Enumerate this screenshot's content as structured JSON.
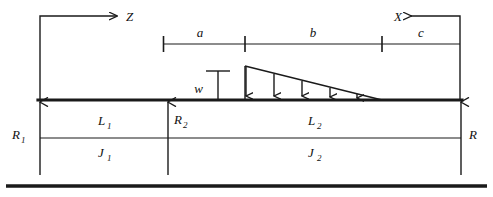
{
  "diagram": {
    "axes": [
      {
        "name": "z-axis",
        "label": "Z",
        "direction": "right"
      },
      {
        "name": "x-axis",
        "label": "X",
        "direction": "left"
      }
    ],
    "dimensions": [
      {
        "name": "dim-a",
        "label": "a",
        "x_start": 163,
        "x_end": 245
      },
      {
        "name": "dim-b",
        "label": "b",
        "x_start": 245,
        "x_end": 382
      },
      {
        "name": "dim-c",
        "label": "c",
        "x_start": 382,
        "x_end": 460
      }
    ],
    "load": {
      "label": "w",
      "type": "triangular-distributed",
      "x_start": 245,
      "x_end": 382,
      "peak_y": 66,
      "base_y": 100,
      "arrow_count": 5
    },
    "supports": [
      {
        "name": "support-R1",
        "label": "R",
        "subscript": "1",
        "x": 40
      },
      {
        "name": "support-R2",
        "label": "R",
        "subscript": "2",
        "x": 168
      },
      {
        "name": "support-R",
        "label": "R",
        "subscript": "",
        "x": 461
      }
    ],
    "spans": [
      {
        "name": "span-L1",
        "label": "L",
        "subscript": "1",
        "center_x": 104
      },
      {
        "name": "span-L2",
        "label": "L",
        "subscript": "2",
        "center_x": 314
      }
    ],
    "inertias": [
      {
        "name": "inertia-J1",
        "label": "J",
        "subscript": "1",
        "center_x": 104
      },
      {
        "name": "inertia-J2",
        "label": "J",
        "subscript": "2",
        "center_x": 314
      }
    ],
    "labels": {
      "z": "Z",
      "x": "X",
      "a": "a",
      "b": "b",
      "c": "c",
      "w": "w",
      "R1_base": "R",
      "R1_sub": "1",
      "R2_base": "R",
      "R2_sub": "2",
      "R_base": "R",
      "L1_base": "L",
      "L1_sub": "1",
      "L2_base": "L",
      "L2_sub": "2",
      "J1_base": "J",
      "J1_sub": "1",
      "J2_base": "J",
      "J2_sub": "2"
    },
    "colors": {
      "line": "#1a1a1a",
      "background": "#ffffff",
      "text": "#111111"
    }
  }
}
